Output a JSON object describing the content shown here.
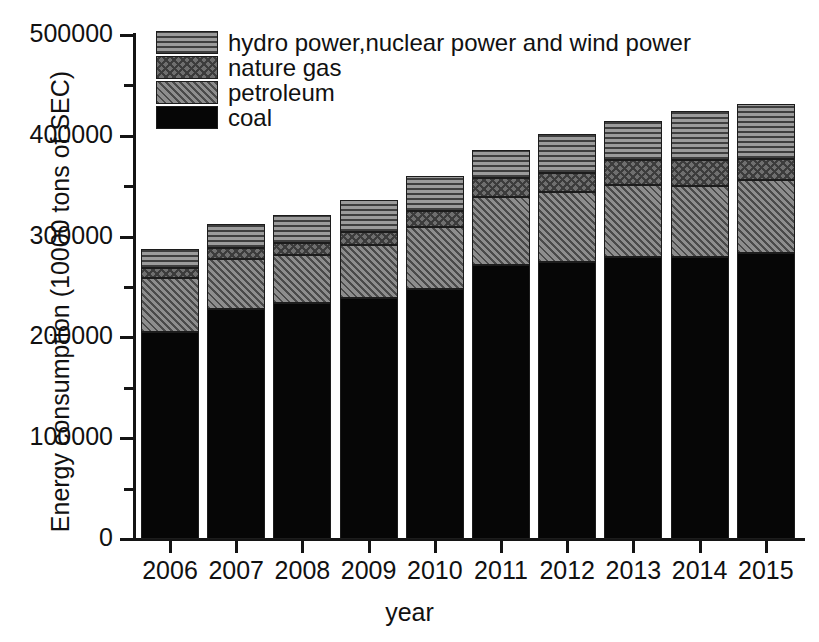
{
  "chart_data": {
    "type": "bar",
    "subtype": "stacked",
    "title": "",
    "xlabel": "year",
    "ylabel": "Energy consumption (10000 tons of SEC)",
    "categories": [
      "2006",
      "2007",
      "2008",
      "2009",
      "2010",
      "2011",
      "2012",
      "2013",
      "2014",
      "2015"
    ],
    "ylim": [
      0,
      500000
    ],
    "ytick_labels": [
      "0",
      "100000",
      "200000",
      "300000",
      "400000",
      "500000"
    ],
    "ytick_values": [
      0,
      100000,
      200000,
      300000,
      400000,
      500000
    ],
    "yminor_values": [
      50000,
      150000,
      250000,
      350000,
      450000
    ],
    "grid": false,
    "legend_position": "top-left inside",
    "stack_order_bottom_to_top": [
      "coal",
      "petroleum",
      "nature gas",
      "hydro power,nuclear power and wind power"
    ],
    "series": [
      {
        "name": "coal",
        "pattern": "solid-black",
        "color": "#060606",
        "values": [
          205400,
          228200,
          234100,
          239000,
          248000,
          271800,
          274800,
          279700,
          279700,
          283700
        ]
      },
      {
        "name": "petroleum",
        "pattern": "diagonal-lines",
        "color": "#787878",
        "values": [
          53600,
          49600,
          47600,
          52600,
          61500,
          67500,
          69400,
          71400,
          70400,
          72400
        ]
      },
      {
        "name": "nature gas",
        "pattern": "crosshatch",
        "color": "#6f6f6f",
        "values": [
          9900,
          10900,
          11900,
          12900,
          15900,
          18800,
          18800,
          24800,
          25800,
          20800
        ]
      },
      {
        "name": "hydro power,nuclear power and wind power",
        "pattern": "horizontal-lines",
        "color": "#8a8a8a",
        "values": [
          18800,
          23800,
          27800,
          31700,
          34700,
          27800,
          38700,
          38700,
          48600,
          54600
        ]
      }
    ],
    "totals": [
      287700,
      312500,
      321400,
      336200,
      360100,
      385900,
      401700,
      414600,
      424500,
      431500
    ]
  },
  "legend": {
    "items": [
      {
        "label": "hydro power,nuclear power and wind power",
        "pattern": "horizontal-lines"
      },
      {
        "label": "nature gas",
        "pattern": "crosshatch"
      },
      {
        "label": "petroleum",
        "pattern": "diagonal-lines"
      },
      {
        "label": "coal",
        "pattern": "solid-black"
      }
    ]
  }
}
